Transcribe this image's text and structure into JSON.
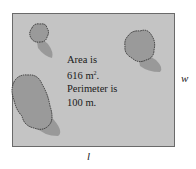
{
  "diagram": {
    "shape": "rectangle",
    "fill_color": "#c4c4c4",
    "border_color": "#6a6a6a",
    "caption": {
      "line1": "Area is",
      "line2_value": "616 m",
      "line2_exp": "2",
      "line2_end": ".",
      "line3": "Perimeter is",
      "line4": "100 m."
    },
    "labels": {
      "width": "w",
      "length": "l"
    },
    "trees": [
      {
        "name": "tree-top-left"
      },
      {
        "name": "tree-top-right"
      },
      {
        "name": "tree-bottom-left"
      }
    ]
  }
}
